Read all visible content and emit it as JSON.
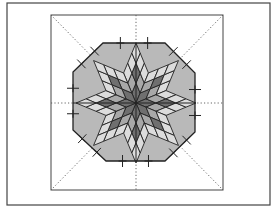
{
  "diagram": {
    "type": "quilt-block-layout",
    "colors": {
      "background": "#ffffff",
      "frame": "#444444",
      "octagon_fill": "#b9b9b9",
      "light_diamond": "#dcdcdc",
      "mid_diamond": "#a8a8a8",
      "dark_diamond": "#6f6f6f",
      "line": "#222222",
      "guide": "#555555"
    },
    "outer_frame": {
      "x": 7,
      "y": 3,
      "w": 263,
      "h": 202
    },
    "inner_square": {
      "x": 51,
      "y": 15,
      "w": 172,
      "h": 175
    },
    "center": {
      "x": 136,
      "y": 103
    },
    "octagon_points": [
      [
        103,
        43
      ],
      [
        165,
        43
      ],
      [
        195,
        73
      ],
      [
        195,
        132
      ],
      [
        165,
        161
      ],
      [
        106,
        161
      ],
      [
        73,
        130
      ],
      [
        73,
        72
      ]
    ],
    "star_points": 8,
    "tick_marks": 16
  }
}
